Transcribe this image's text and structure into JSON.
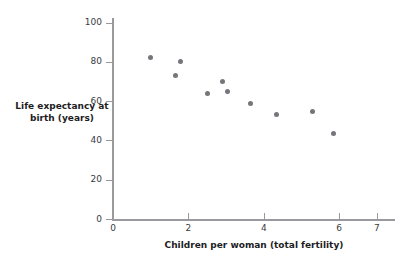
{
  "chart_data": {
    "type": "scatter",
    "title": "",
    "xlabel": "Children per woman (total fertility)",
    "ylabel": "Life expectancy at birth (years)",
    "xlim": [
      0,
      7.4
    ],
    "ylim": [
      0,
      104
    ],
    "xticks": [
      0,
      2,
      4,
      6,
      7
    ],
    "xticklabels": [
      "0",
      "2",
      "4",
      "6",
      "7"
    ],
    "yticks": [
      0,
      20,
      40,
      60,
      80,
      100
    ],
    "yticklabels": [
      "0",
      "20",
      "40",
      "60",
      "80",
      "100"
    ],
    "grid": false,
    "legend": false,
    "marker_color": "#75757b",
    "axis_color": "#9a9a9e",
    "points": [
      {
        "x": 1.0,
        "y": 82
      },
      {
        "x": 1.65,
        "y": 73
      },
      {
        "x": 1.8,
        "y": 80
      },
      {
        "x": 2.5,
        "y": 64
      },
      {
        "x": 2.9,
        "y": 70
      },
      {
        "x": 3.05,
        "y": 65
      },
      {
        "x": 3.65,
        "y": 59
      },
      {
        "x": 4.35,
        "y": 53
      },
      {
        "x": 5.3,
        "y": 54.5
      },
      {
        "x": 5.85,
        "y": 43.5
      }
    ]
  }
}
